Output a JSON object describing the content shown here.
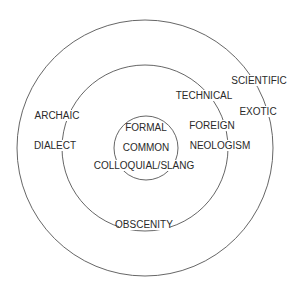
{
  "diagram": {
    "type": "concentric-circles",
    "stroke_color": "#555555",
    "text_color": "#2a2a2a",
    "rings": [
      {
        "name": "outer",
        "cx": 145,
        "cy": 148,
        "r": 128
      },
      {
        "name": "middle",
        "cx": 145,
        "cy": 148,
        "r": 83
      },
      {
        "name": "inner",
        "cx": 146,
        "cy": 148,
        "r": 32
      }
    ],
    "labels": {
      "formal": "FORMAL",
      "common": "COMMON",
      "colloquial_slang": "COLLOQUIAL/SLANG",
      "archaic": "ARCHAIC",
      "dialect": "DIALECT",
      "technical": "TECHNICAL",
      "scientific": "SCIENTIFIC",
      "exotic": "EXOTIC",
      "foreign": "FOREIGN",
      "neologism": "NEOLOGISM",
      "obscenity": "OBSCENITY"
    }
  }
}
